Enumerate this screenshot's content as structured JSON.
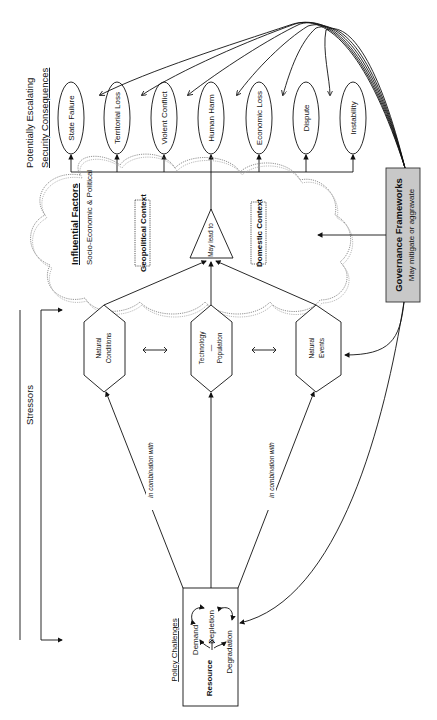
{
  "diagram": {
    "consequences": {
      "title_line1": "Potentially Escalating",
      "title_line2": "Security Consequences",
      "items": [
        "State Failure",
        "Territorial Loss",
        "Violent Conflict",
        "Human Harm",
        "Economic Loss",
        "Dispute",
        "Instability"
      ]
    },
    "influential": {
      "title": "Influential Factors",
      "subtitle": "Socio-Economic  &  Political",
      "geopolitical": "Geopolitical Context",
      "domestic": "Domestic Context",
      "may_lead_to": "May lead to"
    },
    "governance": {
      "title": "Governance Frameworks",
      "subtitle": "May mitigate  or  aggravate",
      "fill": "#c8c8c8"
    },
    "stressors": {
      "label": "Stressors",
      "natural_conditions_1": "Natural",
      "natural_conditions_2": "Conditions",
      "technology": "Technology",
      "dash": "—",
      "population": "Population",
      "natural_events_1": "Natural",
      "natural_events_2": "Events",
      "in_combination_1": "in combination with",
      "in_combination_2": "in combination with"
    },
    "policy": {
      "title": "Policy Challenges",
      "resource": "Resource",
      "demand": "Demand",
      "depletion": "Depletion",
      "degradation": "Degradation"
    }
  }
}
